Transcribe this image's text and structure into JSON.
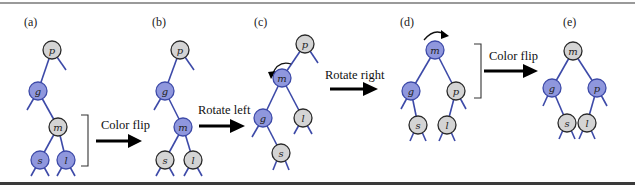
{
  "figure": {
    "colors": {
      "red_node": "#8f97dd",
      "black_node": "#d4d4d4",
      "edge": "#3d4aa8"
    },
    "panels": [
      {
        "label": "(a)",
        "nodes": [
          {
            "id": "p",
            "label": "p",
            "color": "gray"
          },
          {
            "id": "g",
            "label": "g",
            "color": "blue"
          },
          {
            "id": "m",
            "label": "m",
            "color": "gray"
          },
          {
            "id": "s",
            "label": "s",
            "color": "blue"
          },
          {
            "id": "l",
            "label": "l",
            "color": "blue"
          }
        ]
      },
      {
        "label": "(b)",
        "nodes": [
          {
            "id": "p",
            "label": "p",
            "color": "gray"
          },
          {
            "id": "g",
            "label": "g",
            "color": "blue"
          },
          {
            "id": "m",
            "label": "m",
            "color": "blue"
          },
          {
            "id": "s",
            "label": "s",
            "color": "gray"
          },
          {
            "id": "l",
            "label": "l",
            "color": "gray"
          }
        ]
      },
      {
        "label": "(c)",
        "nodes": [
          {
            "id": "p",
            "label": "p",
            "color": "gray"
          },
          {
            "id": "m",
            "label": "m",
            "color": "blue"
          },
          {
            "id": "g",
            "label": "g",
            "color": "blue"
          },
          {
            "id": "l",
            "label": "l",
            "color": "gray"
          },
          {
            "id": "s",
            "label": "s",
            "color": "gray"
          }
        ]
      },
      {
        "label": "(d)",
        "nodes": [
          {
            "id": "m",
            "label": "m",
            "color": "blue"
          },
          {
            "id": "g",
            "label": "g",
            "color": "blue"
          },
          {
            "id": "p",
            "label": "p",
            "color": "gray"
          },
          {
            "id": "s",
            "label": "s",
            "color": "gray"
          },
          {
            "id": "l",
            "label": "l",
            "color": "gray"
          }
        ]
      },
      {
        "label": "(e)",
        "nodes": [
          {
            "id": "m",
            "label": "m",
            "color": "gray"
          },
          {
            "id": "g",
            "label": "g",
            "color": "blue"
          },
          {
            "id": "p",
            "label": "p",
            "color": "blue"
          },
          {
            "id": "s",
            "label": "s",
            "color": "gray"
          },
          {
            "id": "l",
            "label": "l",
            "color": "gray"
          }
        ]
      }
    ],
    "operations": [
      {
        "label": "Color flip",
        "from": "(a)",
        "to": "(b)"
      },
      {
        "label": "Rotate left",
        "from": "(b)",
        "to": "(c)"
      },
      {
        "label": "Rotate right",
        "from": "(c)",
        "to": "(d)"
      },
      {
        "label": "Color flip",
        "from": "(d)",
        "to": "(e)"
      }
    ]
  }
}
